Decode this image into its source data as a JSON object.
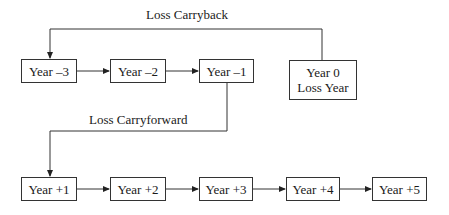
{
  "diagram": {
    "carryback_label": "Loss Carryback",
    "carryforward_label": "Loss Carryforward",
    "loss_year": {
      "line1": "Year 0",
      "line2": "Loss Year"
    },
    "top_row": [
      {
        "label": "Year –3"
      },
      {
        "label": "Year –2"
      },
      {
        "label": "Year –1"
      }
    ],
    "bottom_row": [
      {
        "label": "Year +1"
      },
      {
        "label": "Year +2"
      },
      {
        "label": "Year +3"
      },
      {
        "label": "Year +4"
      },
      {
        "label": "Year +5"
      }
    ],
    "colors": {
      "line": "#333333",
      "box_border": "#333333",
      "text": "#1a1a1a",
      "background": "#ffffff"
    }
  }
}
